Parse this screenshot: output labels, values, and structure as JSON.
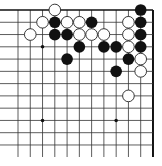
{
  "board": {
    "description": "Go board diagram, upper-right corner section",
    "columns": 12,
    "rows": 13,
    "origin_x": 18,
    "origin_y": 10,
    "spacing": 12.27,
    "line_bottom": 157,
    "line_color": "#333333",
    "edge_color": "#111111",
    "top_edge": true,
    "right_edge": true,
    "star_points": [
      {
        "col": 2,
        "row": 3
      },
      {
        "col": 2,
        "row": 9
      },
      {
        "col": 8,
        "row": 9
      }
    ],
    "black_stones": [
      {
        "col": 10,
        "row": 0
      },
      {
        "col": 3,
        "row": 1
      },
      {
        "col": 6,
        "row": 1
      },
      {
        "col": 10,
        "row": 1
      },
      {
        "col": 3,
        "row": 2
      },
      {
        "col": 4,
        "row": 2
      },
      {
        "col": 10,
        "row": 2
      },
      {
        "col": 5,
        "row": 3
      },
      {
        "col": 7,
        "row": 3
      },
      {
        "col": 8,
        "row": 3
      },
      {
        "col": 10,
        "row": 3
      },
      {
        "col": 4,
        "row": 4
      },
      {
        "col": 9,
        "row": 4
      },
      {
        "col": 8,
        "row": 5
      }
    ],
    "white_stones": [
      {
        "col": 3,
        "row": 0
      },
      {
        "col": 2,
        "row": 1
      },
      {
        "col": 4,
        "row": 1
      },
      {
        "col": 5,
        "row": 1
      },
      {
        "col": 9,
        "row": 1
      },
      {
        "col": 1,
        "row": 2
      },
      {
        "col": 5,
        "row": 2
      },
      {
        "col": 6,
        "row": 2
      },
      {
        "col": 7,
        "row": 2
      },
      {
        "col": 9,
        "row": 2
      },
      {
        "col": 9,
        "row": 3
      },
      {
        "col": 10,
        "row": 4
      },
      {
        "col": 10,
        "row": 5
      },
      {
        "col": 9,
        "row": 7
      }
    ],
    "colors": {
      "black_stone": "#111111",
      "white_stone_fill": "#ffffff",
      "white_stone_stroke": "#222222",
      "star_point": "#111111"
    }
  }
}
